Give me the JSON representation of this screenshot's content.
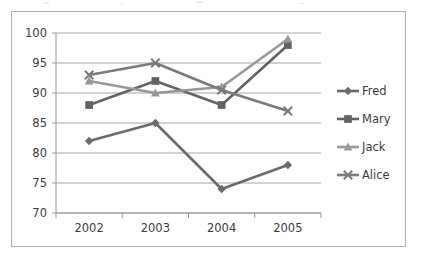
{
  "chart_data": {
    "type": "line",
    "title": "",
    "subtitle": "",
    "xlabel": "",
    "ylabel": "",
    "categories": [
      "2002",
      "2003",
      "2004",
      "2005"
    ],
    "ylim": [
      70,
      100
    ],
    "yticks": [
      70,
      75,
      80,
      85,
      90,
      95,
      100
    ],
    "ytick_labels": [
      "70",
      "75",
      "80",
      "85",
      "90",
      "95",
      "100"
    ],
    "grid": true,
    "grid_axis": "y",
    "legend_position": "right",
    "series": [
      {
        "name": "Fred",
        "values": [
          82,
          85,
          74,
          78
        ],
        "color": "#6b6b6b",
        "marker": "diamond"
      },
      {
        "name": "Mary",
        "values": [
          88,
          92,
          88,
          98
        ],
        "color": "#636363",
        "marker": "square"
      },
      {
        "name": "Jack",
        "values": [
          92,
          90,
          91,
          99
        ],
        "color": "#989898",
        "marker": "triangle"
      },
      {
        "name": "Alice",
        "values": [
          93,
          95,
          90.5,
          87
        ],
        "color": "#7a7a7a",
        "marker": "x"
      }
    ]
  },
  "colors": {
    "frame_border": "#b0b0b0",
    "gridline": "#a6a6a6",
    "axis_line": "#9a9a9a",
    "tick_text": "#3b3b3b",
    "background": "#ffffff"
  },
  "legend": {
    "entries": [
      {
        "label": "Fred"
      },
      {
        "label": "Mary"
      },
      {
        "label": "Jack"
      },
      {
        "label": "Alice"
      }
    ]
  },
  "axes": {
    "y_tick_labels": [
      "100",
      "95",
      "90",
      "85",
      "80",
      "75",
      "70"
    ],
    "x_tick_labels": [
      "2002",
      "2003",
      "2004",
      "2005"
    ]
  }
}
